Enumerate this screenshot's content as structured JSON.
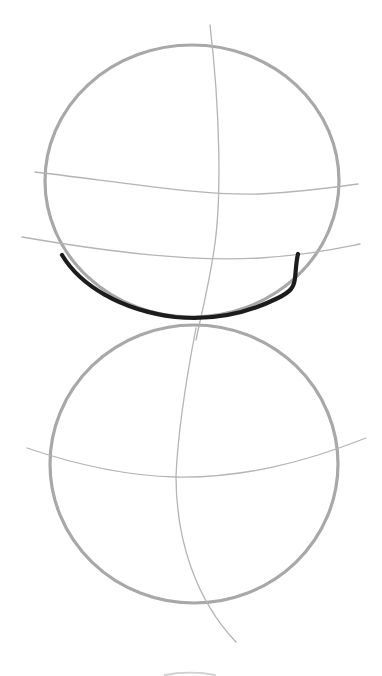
{
  "drawing": {
    "description": "Pencil construction sketch of two stacked circles with guide lines; a dark stroke traces the lower-left edge of the top circle",
    "colors": {
      "background": "#ffffff",
      "circle_stroke": "#a8a8a8",
      "guide_stroke": "#b4b4b4",
      "ink_stroke": "#1e1e1e"
    },
    "top_circle": {
      "cx": 192,
      "cy": 181,
      "rx": 147,
      "ry": 136,
      "vertical_guide": "M210,25 C220,110 222,200 214,250 C208,290 200,320 196,340",
      "horizontal_guides": [
        "M35,172 C120,182 200,196 260,194 C300,192 330,188 358,184",
        "M22,237 C110,252 190,262 260,258 C310,255 340,248 360,244"
      ],
      "ink_stroke": "M62,255 C80,285 120,310 175,317 C215,321 250,312 278,298 C290,292 294,288 295,278 C296,270 296,262 298,254"
    },
    "bottom_circle": {
      "cx": 194,
      "cy": 464,
      "rx": 144,
      "ry": 139,
      "vertical_guide": "M196,328 C186,380 178,430 176,476 C176,540 196,600 236,642",
      "horizontal_guide": "M27,448 C80,466 130,476 176,477 C240,478 300,464 366,438"
    },
    "footer_marks": "M165,675 C180,672 200,672 215,675"
  }
}
